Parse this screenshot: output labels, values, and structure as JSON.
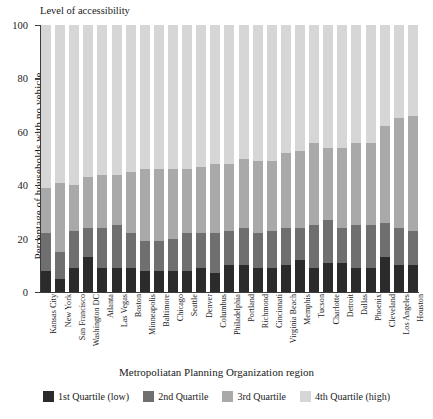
{
  "legend_title": "Level of accessibility",
  "chart_data": {
    "type": "bar",
    "stacked": true,
    "title": "",
    "xlabel": "Metropoliatan Planning Organization region",
    "ylabel": "Percentage of households with no vehicle",
    "ylim": [
      0,
      100
    ],
    "yticks": [
      0,
      20,
      40,
      60,
      80,
      100
    ],
    "ytick_labels": [
      "0",
      "20",
      "40",
      "60",
      "80",
      "100"
    ],
    "grid": false,
    "legend_position": "bottom",
    "categories": [
      "Kansas City",
      "New York",
      "San Francisco",
      "Washington DC",
      "Atlanta",
      "Las Vegas",
      "Boston",
      "Minneapolis",
      "Baltimore",
      "Chicago",
      "Seattle",
      "Denver",
      "Columbus",
      "Philadelphia",
      "Portland",
      "Richmond",
      "Cincinnati",
      "Virginia Beach",
      "Memphis",
      "Tucson",
      "Charlotte",
      "Detroit",
      "Dallas",
      "Phoenix",
      "Cleveland",
      "Los Angeles",
      "Houston"
    ],
    "series": [
      {
        "name": "1st Quartile (low)",
        "color": "#2b2b2b",
        "values": [
          8,
          5,
          9,
          13,
          9,
          9,
          9,
          8,
          8,
          8,
          8,
          9,
          7,
          10,
          10,
          9,
          9,
          10,
          12,
          9,
          11,
          11,
          9,
          9,
          13,
          10,
          10
        ]
      },
      {
        "name": "2nd Quartile",
        "color": "#6f6f6f",
        "values": [
          14,
          10,
          14,
          11,
          15,
          16,
          13,
          11,
          11,
          12,
          14,
          13,
          15,
          13,
          14,
          13,
          14,
          14,
          12,
          16,
          16,
          13,
          16,
          16,
          13,
          14,
          13
        ]
      },
      {
        "name": "3rd Quartile",
        "color": "#a9a9a9",
        "values": [
          17,
          26,
          17,
          19,
          20,
          19,
          23,
          27,
          27,
          26,
          24,
          25,
          26,
          25,
          26,
          27,
          26,
          28,
          29,
          31,
          27,
          30,
          31,
          31,
          36,
          41,
          43
        ]
      },
      {
        "name": "4th Quartile (high)",
        "color": "#d6d6d6",
        "values": [
          61,
          59,
          60,
          57,
          56,
          56,
          55,
          54,
          54,
          54,
          54,
          53,
          52,
          52,
          50,
          51,
          51,
          48,
          47,
          44,
          46,
          46,
          44,
          44,
          38,
          35,
          34
        ]
      }
    ]
  }
}
